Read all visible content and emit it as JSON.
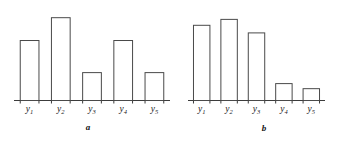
{
  "figure": {
    "background_color": "#ffffff",
    "bar_stroke_color": "#4a4a4a",
    "axis_color": "#3c3c3c",
    "label_color": "#1a1a1a"
  },
  "chart_data": [
    {
      "type": "bar",
      "panel": "a",
      "caption": "a",
      "title": "",
      "xlabel": "",
      "ylabel": "",
      "grid": false,
      "legend": "none",
      "ylim": [
        0,
        100
      ],
      "categories": [
        "y1",
        "y2",
        "y3",
        "y4",
        "y5"
      ],
      "tick_labels": [
        {
          "base": "y",
          "sub": "1"
        },
        {
          "base": "y",
          "sub": "2"
        },
        {
          "base": "y",
          "sub": "3"
        },
        {
          "base": "y",
          "sub": "4"
        },
        {
          "base": "y",
          "sub": "5"
        }
      ],
      "values": [
        71,
        98,
        33,
        71,
        33
      ]
    },
    {
      "type": "bar",
      "panel": "b",
      "caption": "b",
      "title": "",
      "xlabel": "",
      "ylabel": "",
      "grid": false,
      "legend": "none",
      "ylim": [
        0,
        100
      ],
      "categories": [
        "y1",
        "y2",
        "y3",
        "y4",
        "y5"
      ],
      "tick_labels": [
        {
          "base": "y",
          "sub": "1"
        },
        {
          "base": "y",
          "sub": "2"
        },
        {
          "base": "y",
          "sub": "3"
        },
        {
          "base": "y",
          "sub": "4"
        },
        {
          "base": "y",
          "sub": "5"
        }
      ],
      "values": [
        89,
        96,
        80,
        20,
        14
      ]
    }
  ]
}
